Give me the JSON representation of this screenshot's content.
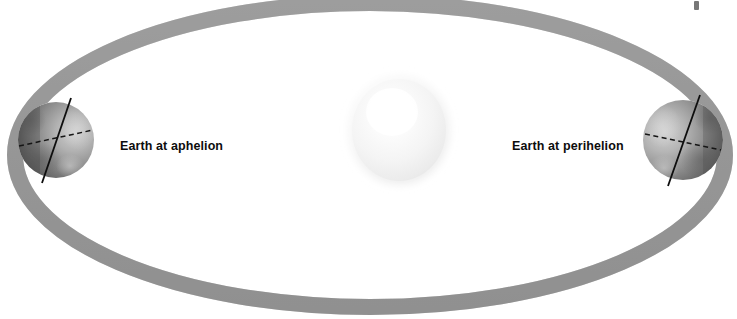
{
  "diagram": {
    "type": "astronomy-orbit-diagram",
    "background_color": "#ffffff",
    "width": 737,
    "height": 319
  },
  "labels": {
    "aphelion": "Earth at aphelion",
    "perihelion": "Earth at perihelion",
    "text_color": "#0d0d0d"
  },
  "sun": {
    "name": "Sun",
    "center_x": 399,
    "center_y": 130,
    "radius_x": 51,
    "radius_y": 55,
    "core_color": "#fdfdfd",
    "mid_color": "#f2f2f2",
    "edge_color": "#e4e4e4"
  },
  "orbit": {
    "name": "elliptical-orbit-path",
    "center_x": 370,
    "center_y": 155,
    "semi_major": 355,
    "semi_minor": 152,
    "band_thickness": 16,
    "band_color": "#9b9b9b",
    "band_color_light": "#ababab",
    "band_color_dark": "#8c8c8c"
  },
  "earths": [
    {
      "name": "earth-at-aphelion",
      "position": "left",
      "center_x": 56,
      "center_y": 140,
      "radius": 38,
      "lit_side": "right",
      "dark_color": "#4b4b4b",
      "mid_color": "#8a8a8a",
      "light_color": "#c3c3c3",
      "axis_tilt_deg": 23.5,
      "axis_color": "#111111",
      "equator_color": "#161616"
    },
    {
      "name": "earth-at-perihelion",
      "position": "right",
      "center_x": 683,
      "center_y": 140,
      "radius": 40,
      "lit_side": "left",
      "dark_color": "#555555",
      "mid_color": "#8e8e8e",
      "light_color": "#c6c6c6",
      "axis_tilt_deg": 23.5,
      "axis_color": "#111111",
      "equator_color": "#161616"
    }
  ],
  "artifacts": [
    {
      "name": "scan-speck-top-right",
      "x": 694,
      "y": 1,
      "w": 5,
      "h": 9
    }
  ]
}
